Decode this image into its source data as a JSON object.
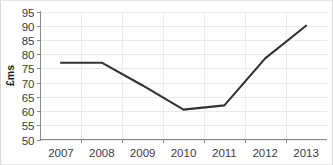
{
  "chart_data": {
    "type": "line",
    "title": "",
    "subtitle": "",
    "xlabel": "",
    "ylabel": "£ms",
    "x": [
      "2007",
      "2008",
      "2009",
      "2010",
      "2011",
      "2012",
      "2013"
    ],
    "categories": [
      "2007",
      "2008",
      "2009",
      "2010",
      "2011",
      "2012",
      "2013"
    ],
    "values": [
      77,
      77,
      69,
      60.5,
      62,
      78.5,
      90
    ],
    "series": [
      {
        "name": "",
        "values": [
          77,
          77,
          69,
          60.5,
          62,
          78.5,
          90
        ]
      }
    ],
    "ylim": [
      50,
      95
    ],
    "yticks": [
      50,
      55,
      60,
      65,
      70,
      75,
      80,
      85,
      90,
      95
    ],
    "ytick_labels": [
      "50",
      "55",
      "60",
      "65",
      "70",
      "75",
      "80",
      "85",
      "90",
      "95"
    ],
    "xtick_labels": [
      "2007",
      "2008",
      "2009",
      "2010",
      "2011",
      "2012",
      "2013"
    ],
    "grid": true,
    "grid_axis": "both",
    "legend": false,
    "legend_position": "none",
    "line_color": "#333333",
    "grid_color": "#e9e9e9",
    "axis_color": "#8a8a8a",
    "background_color": "#ffffff",
    "annotations": []
  }
}
